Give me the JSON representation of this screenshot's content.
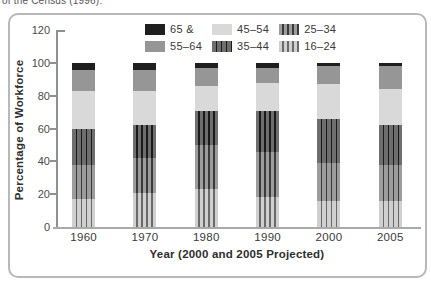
{
  "caption_fragment": "of the Census (1996).",
  "chart_data": {
    "type": "bar",
    "stacked": true,
    "title": "",
    "xlabel": "Year (2000 and 2005 Projected)",
    "ylabel": "Percentage of Workforce",
    "ylim": [
      0,
      120
    ],
    "yticks": [
      0,
      20,
      40,
      60,
      80,
      100,
      120
    ],
    "grid": false,
    "legend_position": "top",
    "categories": [
      "1960",
      "1970",
      "1980",
      "1990",
      "2000",
      "2005"
    ],
    "series": [
      {
        "name": "16–24",
        "pattern": "striped",
        "color": "#d0d0d0",
        "stripe": "#6a6a6a",
        "values": [
          17,
          21,
          23,
          18,
          16,
          16
        ]
      },
      {
        "name": "25–34",
        "pattern": "striped",
        "color": "#9c9c9c",
        "stripe": "#3a3a3a",
        "values": [
          21,
          21,
          27,
          28,
          23,
          22
        ]
      },
      {
        "name": "35–44",
        "pattern": "striped",
        "color": "#6e6e6e",
        "stripe": "#1a1a1a",
        "values": [
          22,
          20,
          21,
          25,
          27,
          24
        ]
      },
      {
        "name": "45–54",
        "pattern": "solid",
        "color": "#d9d9d9",
        "values": [
          23,
          21,
          15,
          17,
          21,
          22
        ]
      },
      {
        "name": "55–64",
        "pattern": "solid",
        "color": "#969696",
        "values": [
          13,
          13,
          11,
          9,
          11,
          14
        ]
      },
      {
        "name": "65 &",
        "pattern": "solid",
        "color": "#1f1f1f",
        "values": [
          4,
          4,
          3,
          3,
          2,
          2
        ]
      }
    ],
    "legend_order": [
      "65 &",
      "45–54",
      "25–34",
      "55–64",
      "35–44",
      "16–24"
    ]
  }
}
